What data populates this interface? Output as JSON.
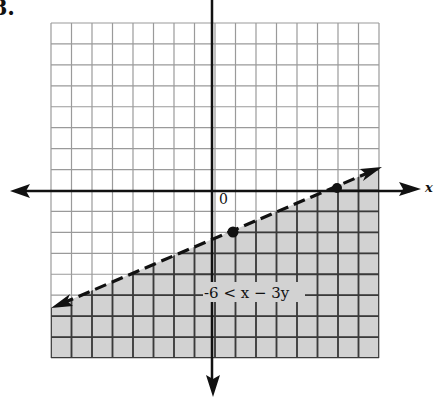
{
  "problem": {
    "number": "8."
  },
  "graph": {
    "x_axis_label": "x",
    "origin_label": "0",
    "inequality_label": "-6 < x − 3y",
    "grid": {
      "columns": 16,
      "rows": 16,
      "left": 51,
      "top": 23,
      "right": 379,
      "bottom": 358
    },
    "axes": {
      "x_axis_y": 191,
      "y_axis_x": 212
    },
    "boundary_line": {
      "style": "dashed",
      "points": [
        [
          52,
          308
        ],
        [
          380,
          168
        ]
      ]
    },
    "points": [
      [
        233,
        232
      ],
      [
        337,
        188
      ]
    ],
    "shaded_region": "below boundary line",
    "colors": {
      "shade": "#d2d2d2",
      "grid_light": "#9a9a9a",
      "grid_dark": "#3a3a3a",
      "ink": "#111111"
    }
  }
}
